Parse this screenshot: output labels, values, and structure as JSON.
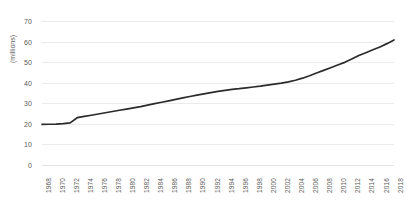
{
  "chart_data": {
    "type": "line",
    "title": "",
    "xlabel": "",
    "ylabel": "(millions)",
    "ylim": [
      0,
      70
    ],
    "yticks": [
      0,
      10,
      20,
      30,
      40,
      50,
      60,
      70
    ],
    "xlim": [
      1968,
      2018
    ],
    "xticks": [
      1968,
      1970,
      1972,
      1974,
      1976,
      1978,
      1980,
      1982,
      1984,
      1986,
      1988,
      1990,
      1992,
      1994,
      1996,
      1998,
      2000,
      2002,
      2004,
      2006,
      2008,
      2010,
      2012,
      2014,
      2016,
      2018
    ],
    "grid": true,
    "legend": "none",
    "series": [
      {
        "name": "total",
        "color": "#2b2b2b",
        "x": [
          1968,
          1969,
          1970,
          1971,
          1972,
          1973,
          1974,
          1975,
          1976,
          1977,
          1978,
          1979,
          1980,
          1981,
          1982,
          1983,
          1984,
          1985,
          1986,
          1987,
          1988,
          1989,
          1990,
          1991,
          1992,
          1993,
          1994,
          1995,
          1996,
          1997,
          1998,
          1999,
          2000,
          2001,
          2002,
          2003,
          2004,
          2005,
          2006,
          2007,
          2008,
          2009,
          2010,
          2011,
          2012,
          2013,
          2014,
          2015,
          2016,
          2017,
          2018
        ],
        "values": [
          19.7,
          19.8,
          19.9,
          20.1,
          20.5,
          23.0,
          23.6,
          24.2,
          24.8,
          25.4,
          26.0,
          26.6,
          27.2,
          27.8,
          28.4,
          29.1,
          29.8,
          30.5,
          31.2,
          31.9,
          32.6,
          33.3,
          34.0,
          34.6,
          35.2,
          35.8,
          36.3,
          36.8,
          37.1,
          37.5,
          37.9,
          38.3,
          38.8,
          39.3,
          39.8,
          40.4,
          41.2,
          42.2,
          43.4,
          44.7,
          46.0,
          47.3,
          48.6,
          49.9,
          51.5,
          53.2,
          54.6,
          56.0,
          57.4,
          59.0,
          60.8
        ]
      }
    ]
  }
}
